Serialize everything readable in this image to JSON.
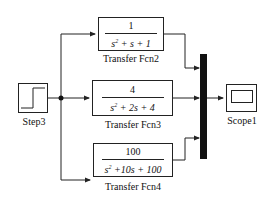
{
  "diagram": {
    "type": "simulink-block-diagram",
    "blocks": {
      "step": {
        "label": "Step3"
      },
      "tf2": {
        "label": "Transfer Fcn2",
        "numerator": "1",
        "denominator": {
          "pre": "s",
          "exp": "2",
          "post": " + s + 1"
        }
      },
      "tf3": {
        "label": "Transfer Fcn3",
        "numerator": "4",
        "denominator": {
          "pre": "s",
          "exp": "2",
          "post": " + 2s + 4"
        }
      },
      "tf4": {
        "label": "Transfer Fcn4",
        "numerator": "100",
        "denominator": {
          "pre": "s",
          "exp": "2",
          "post": " +10s + 100"
        }
      },
      "mux": {
        "label": ""
      },
      "scope": {
        "label": "Scope1"
      }
    },
    "connections": [
      {
        "from": "Step3",
        "to": "Transfer Fcn2"
      },
      {
        "from": "Step3",
        "to": "Transfer Fcn3"
      },
      {
        "from": "Step3",
        "to": "Transfer Fcn4"
      },
      {
        "from": "Transfer Fcn2",
        "to": "Mux",
        "port": 1
      },
      {
        "from": "Transfer Fcn3",
        "to": "Mux",
        "port": 2
      },
      {
        "from": "Transfer Fcn4",
        "to": "Mux",
        "port": 3
      },
      {
        "from": "Mux",
        "to": "Scope1"
      }
    ],
    "colors": {
      "line": "#222222",
      "mux": "#111111",
      "background": "#ffffff"
    }
  }
}
